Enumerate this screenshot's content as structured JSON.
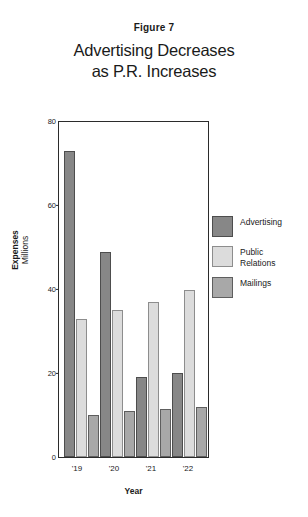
{
  "figure": {
    "number_label": "Figure 7",
    "title_line1": "Advertising Decreases",
    "title_line2": "as P.R. Increases"
  },
  "axes": {
    "ylabel_line1": "Expenses",
    "ylabel_line2": "Millions",
    "xlabel": "Year",
    "ytick_80": "80",
    "ytick_60": "60",
    "ytick_40": "40",
    "ytick_20": "20",
    "ytick_0": "0",
    "xtick_0": "'19",
    "xtick_1": "'20",
    "xtick_2": "'21",
    "xtick_3": "'22"
  },
  "legend": {
    "items": [
      {
        "label_line1": "Advertising",
        "label_line2": "",
        "color": "#878787"
      },
      {
        "label_line1": "Public",
        "label_line2": "Relations",
        "color": "#dcdcdc"
      },
      {
        "label_line1": "Mailings",
        "label_line2": "",
        "color": "#a8a8a8"
      }
    ]
  },
  "chart_data": {
    "type": "bar",
    "title": "Advertising Decreases as P.R. Increases",
    "subtitle": "Figure 7",
    "xlabel": "Year",
    "ylabel": "Expenses Millions",
    "categories": [
      "'19",
      "'20",
      "'21",
      "'22"
    ],
    "series": [
      {
        "name": "Advertising",
        "color": "#878787",
        "values": [
          73,
          49,
          19,
          20
        ]
      },
      {
        "name": "Public Relations",
        "color": "#dcdcdc",
        "values": [
          33,
          35,
          37,
          40
        ]
      },
      {
        "name": "Mailings",
        "color": "#a8a8a8",
        "values": [
          10,
          11,
          11.5,
          12
        ]
      }
    ],
    "ylim": [
      0,
      80
    ],
    "yticks": [
      0,
      20,
      40,
      60,
      80
    ],
    "grid": false,
    "legend_position": "right"
  }
}
